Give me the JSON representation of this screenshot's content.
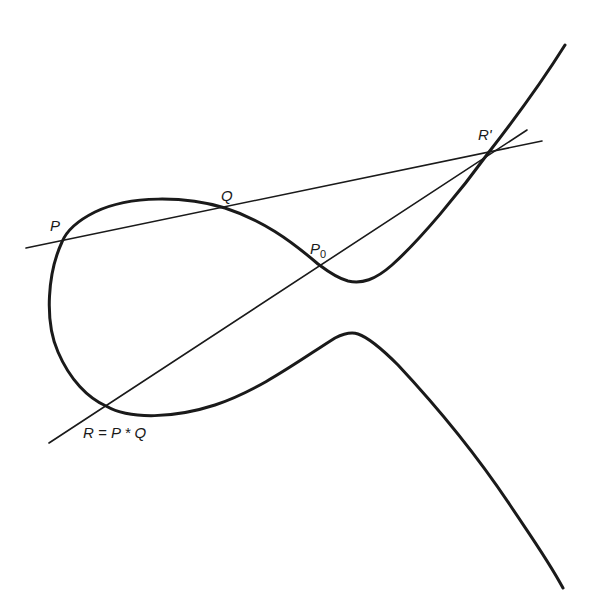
{
  "figure": {
    "stroke_color": "#1a1a1a",
    "background": "#ffffff"
  },
  "labels": {
    "P": "P",
    "Q": "Q",
    "P0_main": "P",
    "P0_sub": "0",
    "R_prime": "R'",
    "R": "R = P * Q"
  }
}
